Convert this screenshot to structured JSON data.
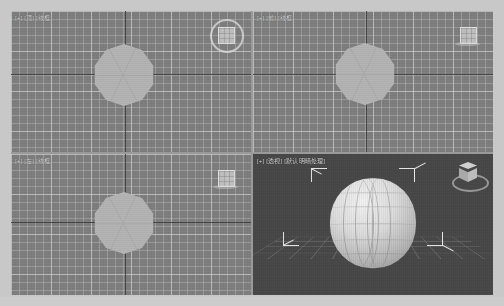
{
  "app": {
    "title": "3ds Max 视口",
    "background_color": "#c8c8c8",
    "frame_color": "#9a9a9a"
  },
  "viewports": [
    {
      "id": "top",
      "label": "[+] [顶] [线框]",
      "type": "orthographic",
      "background_color": "#7e7e7e",
      "grid": true,
      "object": "decagon-sphere",
      "object_color": "#b4b4b4",
      "viewcube": {
        "name": "viewcube-ring",
        "style": "ring"
      }
    },
    {
      "id": "front",
      "label": "[+] [前] [线框]",
      "type": "orthographic",
      "background_color": "#7e7e7e",
      "grid": true,
      "object": "decagon-sphere",
      "object_color": "#b4b4b4",
      "viewcube": {
        "name": "viewcube-square",
        "style": "square"
      }
    },
    {
      "id": "left",
      "label": "[+] [左] [线框]",
      "type": "orthographic",
      "background_color": "#7e7e7e",
      "grid": true,
      "object": "decagon-sphere",
      "object_color": "#b4b4b4",
      "viewcube": {
        "name": "viewcube-square",
        "style": "square"
      }
    },
    {
      "id": "perspective",
      "label": "[+] [透视] [默认明暗处理]",
      "type": "perspective",
      "background_color": "#484848",
      "grid": true,
      "object": "shaded-sphere",
      "object_color": "#dcdcdc",
      "selected": true,
      "viewcube": {
        "name": "viewcube-3d",
        "style": "cube3d"
      }
    }
  ],
  "colors": {
    "ortho_background": "#7e7e7e",
    "perspective_background": "#484848",
    "grid_line": "#bebebe",
    "axis_line": "#3b3b3b",
    "object_fill": "#b4b4b4",
    "selection_bracket": "#e8e8e8",
    "label_text": "#d8d8d8"
  }
}
